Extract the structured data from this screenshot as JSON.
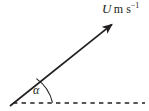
{
  "figure": {
    "name": "velocity-vector-diagram",
    "background_color": "#ffffff",
    "ink_color": "#231f20"
  },
  "vector": {
    "symbol": "U",
    "unit_main": "m s",
    "unit_exponent": "-1",
    "full_label": "U m s-1",
    "start": {
      "x": 10,
      "y": 106
    },
    "end": {
      "x": 117,
      "y": 20
    },
    "color": "#231f20",
    "arrowhead": "solid-filled"
  },
  "baseline": {
    "style": "dashed",
    "start": {
      "x": 13,
      "y": 103
    },
    "end": {
      "x": 145,
      "y": 103
    },
    "color": "#231f20"
  },
  "angle": {
    "symbol": "a",
    "display_symbol": "α",
    "arc_color": "#231f20",
    "arc_radius": 40,
    "vertex": {
      "x": 12,
      "y": 104
    }
  },
  "labels": {
    "magnitude_label_position": {
      "x": 102,
      "y": 2
    },
    "angle_label_position": {
      "x": 33,
      "y": 84
    }
  }
}
